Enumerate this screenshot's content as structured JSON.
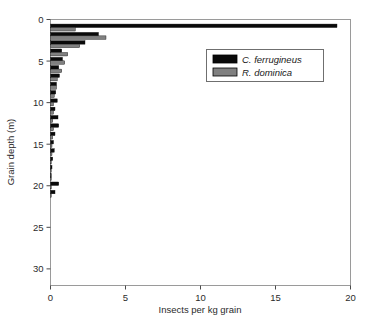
{
  "chart_data": {
    "type": "bar",
    "orientation": "horizontal",
    "title": "",
    "xlabel": "Insects per kg grain",
    "ylabel": "Grain depth (m)",
    "xlim": [
      0,
      20
    ],
    "ylim": [
      0,
      32
    ],
    "y_inverted": true,
    "grid": false,
    "xticks": [
      0,
      5,
      10,
      15,
      20
    ],
    "xticklabels": [
      "0",
      "5",
      "10",
      "15",
      "20"
    ],
    "yticks": [
      0,
      5,
      10,
      15,
      20,
      25,
      30
    ],
    "yticklabels": [
      "0",
      "5",
      "10",
      "15",
      "20",
      "25",
      "30"
    ],
    "legend": {
      "position": "upper-right",
      "entries": [
        {
          "name": "C. ferrugineus",
          "color": "#0a0a0a"
        },
        {
          "name": "R. dominica",
          "color": "#808080"
        }
      ]
    },
    "categories": [
      1,
      2,
      3,
      4,
      5,
      6,
      7,
      8,
      9,
      10,
      11,
      12,
      13,
      14,
      15,
      16,
      17,
      18,
      19,
      20,
      21
    ],
    "series": [
      {
        "name": "C. ferrugineus",
        "color": "#0a0a0a",
        "values": [
          19.1,
          3.2,
          2.3,
          0.75,
          0.8,
          0.55,
          0.6,
          0.4,
          0.35,
          0.45,
          0.3,
          0.5,
          0.55,
          0.3,
          0.2,
          0.25,
          0.15,
          0.1,
          0.05,
          0.55,
          0.3
        ]
      },
      {
        "name": "R. dominica",
        "color": "#808080",
        "values": [
          1.65,
          3.7,
          1.95,
          1.15,
          0.95,
          0.75,
          0.45,
          0.4,
          0.25,
          0.2,
          0.2,
          0.15,
          0.2,
          0.15,
          0.1,
          0.1,
          0.05,
          0.05,
          0.05,
          0.05,
          0.05
        ]
      }
    ]
  },
  "axes": {
    "x_label": "Insects per kg grain",
    "y_label": "Grain depth (m)"
  },
  "legend": {
    "entry_0": "C. ferrugineus",
    "entry_1": "R. dominica"
  },
  "xticks": {
    "t0": "0",
    "t1": "5",
    "t2": "10",
    "t3": "15",
    "t4": "20"
  },
  "yticks": {
    "t0": "0",
    "t1": "5",
    "t2": "10",
    "t3": "15",
    "t4": "20",
    "t5": "25",
    "t6": "30"
  }
}
